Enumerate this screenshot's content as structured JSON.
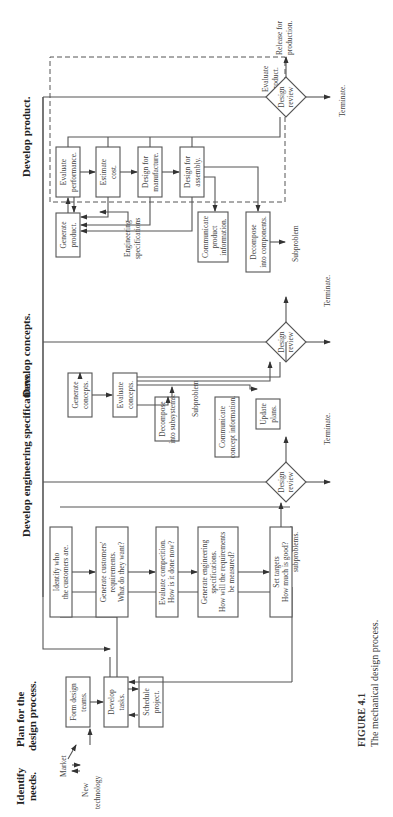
{
  "phases": {
    "identify_needs": [
      "Identify",
      "needs."
    ],
    "plan": [
      "Plan for the",
      "design process."
    ],
    "eng_specs": "Develop engineering specifications.",
    "concepts": "Develop concepts.",
    "product": "Develop product."
  },
  "needs_inputs": {
    "market": "Market",
    "new_tech": [
      "New",
      "technology"
    ]
  },
  "plan_boxes": {
    "form_teams": [
      "Form design",
      "teams."
    ],
    "develop_tasks": [
      "Develop",
      "tasks."
    ],
    "schedule": [
      "Schedule",
      "project."
    ]
  },
  "decompose_subproblems": [
    "Decompose into",
    "subproblems."
  ],
  "spec_boxes": {
    "identify_customers": [
      "Identify who",
      "the customers are."
    ],
    "gen_requirements": [
      "Generate customers'",
      "requirements.",
      "What do they want?"
    ],
    "eval_competition": [
      "Evaluate competition.",
      "How is it done now?"
    ],
    "gen_eng_specs": [
      "Generate engineering",
      "specifications.",
      "How will the requirements",
      "be measured?"
    ],
    "set_targets": [
      "Set targets",
      "How much is good?"
    ]
  },
  "concept_boxes": {
    "generate": [
      "Generate",
      "concepts."
    ],
    "evaluate": [
      "Evaluate",
      "concepts."
    ],
    "decompose": [
      "Decompose",
      "into subsystems."
    ],
    "subproblem": "Subproblem",
    "communicate": [
      "Communicate",
      "concept information."
    ],
    "update": [
      "Update",
      "plans."
    ]
  },
  "product_boxes": {
    "generate": [
      "Generate",
      "product."
    ],
    "eval_performance": [
      "Evaluate",
      "performance."
    ],
    "estimate_cost": [
      "Estimate",
      "cost."
    ],
    "dfm": [
      "Design for",
      "manufacture."
    ],
    "dfa": [
      "Design for",
      "assembly."
    ],
    "evaluate_product": [
      "Evaluate",
      "product."
    ],
    "eng_specs_input": [
      "Engineering",
      "specifications"
    ],
    "communicate": [
      "Communicate",
      "product",
      "information."
    ],
    "decompose": [
      "Decompose",
      "into components."
    ],
    "subproblem": "Subproblem"
  },
  "design_review": [
    "Design",
    "review"
  ],
  "terminate": "Terminate.",
  "release": [
    "Release for",
    "production."
  ],
  "caption": {
    "label": "FIGURE 4.1",
    "text": "The mechanical design process."
  }
}
